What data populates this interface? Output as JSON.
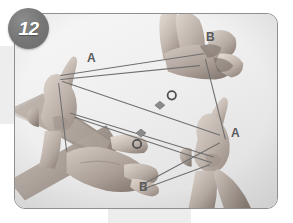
{
  "figure": {
    "step_number": "12",
    "alt_description": "Two pairs of hands holding a looped string figure with crossing strands",
    "frame": {
      "border_color": "#8f8f8f",
      "background_color": "#f2f2f2",
      "corner_radius_px": 11
    },
    "badge": {
      "label": "12",
      "fill_color": "#777777",
      "text_color": "#ffffff"
    },
    "labels": [
      {
        "id": "label-a-top-left",
        "text": "A",
        "x": 87,
        "y": 52
      },
      {
        "id": "label-b-top-right",
        "text": "B",
        "x": 206,
        "y": 31
      },
      {
        "id": "label-a-bottom-right",
        "text": "A",
        "x": 231,
        "y": 127
      },
      {
        "id": "label-b-bottom-left",
        "text": "B",
        "x": 139,
        "y": 181
      }
    ],
    "markers": [
      {
        "id": "marker-o-upper",
        "glyph": "O",
        "x": 172,
        "y": 95
      },
      {
        "id": "marker-o-lower",
        "glyph": "O",
        "x": 137,
        "y": 144
      },
      {
        "id": "marker-diamond-upper",
        "glyph": "diamond",
        "x": 163,
        "y": 105
      },
      {
        "id": "marker-diamond-lower",
        "glyph": "diamond",
        "x": 144,
        "y": 133
      }
    ],
    "colors": {
      "string": "#6f6f6f",
      "label_text": "#5a5a5a",
      "skin_light": "#d6cdc6",
      "skin_mid": "#b3a79f",
      "skin_dark": "#8e8179",
      "page_band": "#ededed"
    }
  }
}
